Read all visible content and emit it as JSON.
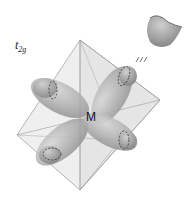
{
  "diagram": {
    "orbital_label": {
      "main": "t",
      "subscript": "2g"
    },
    "center_label": "M",
    "shape": "octahedron",
    "lobes": 4,
    "inset": {
      "symbol": "≡",
      "description": "lobe-cross-section"
    },
    "colors": {
      "octahedron_fill": "#e6e6e6",
      "octahedron_stroke": "#9a9a9a",
      "lobe_fill": "#a8a8a8",
      "lobe_highlight": "#d0d0d0",
      "dashed_ring": "#333333"
    }
  }
}
